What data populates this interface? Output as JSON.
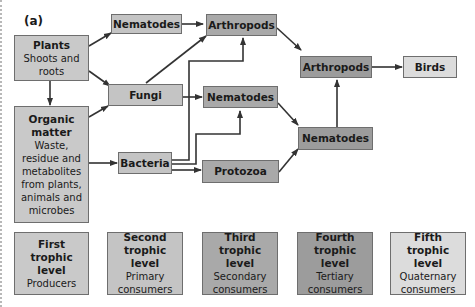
{
  "panel_label": "(a)",
  "nodes": {
    "plants": {
      "title": "Plants",
      "subtitle": "Shoots and roots"
    },
    "organic_matter": {
      "title": "Organic matter",
      "subtitle": "Waste, residue and metabolites from plants, animals and microbes"
    },
    "nematodes_top": {
      "title": "Nematodes"
    },
    "fungi": {
      "title": "Fungi"
    },
    "bacteria": {
      "title": "Bacteria"
    },
    "arthropods_top": {
      "title": "Arthropods"
    },
    "nematodes_mid": {
      "title": "Nematodes"
    },
    "protozoa": {
      "title": "Protozoa"
    },
    "arthropods_right": {
      "title": "Arthropods"
    },
    "nematodes_right": {
      "title": "Nematodes"
    },
    "birds": {
      "title": "Birds"
    }
  },
  "edges": [
    [
      "plants",
      "nematodes_top"
    ],
    [
      "plants",
      "fungi"
    ],
    [
      "plants",
      "organic_matter"
    ],
    [
      "organic_matter",
      "fungi"
    ],
    [
      "organic_matter",
      "bacteria"
    ],
    [
      "nematodes_top",
      "arthropods_top"
    ],
    [
      "fungi",
      "arthropods_top"
    ],
    [
      "fungi",
      "nematodes_mid"
    ],
    [
      "bacteria",
      "arthropods_top"
    ],
    [
      "bacteria",
      "nematodes_mid"
    ],
    [
      "bacteria",
      "protozoa"
    ],
    [
      "arthropods_top",
      "arthropods_right"
    ],
    [
      "nematodes_mid",
      "nematodes_right"
    ],
    [
      "protozoa",
      "nematodes_right"
    ],
    [
      "nematodes_right",
      "arthropods_right"
    ],
    [
      "arthropods_right",
      "birds"
    ]
  ],
  "legend": [
    {
      "title": "First trophic level",
      "subtitle": "Producers"
    },
    {
      "title": "Second trophic level",
      "subtitle": "Primary consumers"
    },
    {
      "title": "Third trophic level",
      "subtitle": "Secondary consumers"
    },
    {
      "title": "Fourth trophic level",
      "subtitle": "Tertiary consumers"
    },
    {
      "title": "Fifth trophic level",
      "subtitle": "Quaternary consumers"
    }
  ],
  "colors": {
    "first": "#c9c9c9",
    "second": "#c4c4c4",
    "third": "#a9a9a9",
    "fourth": "#9c9c9c",
    "fifth": "#dcdcdc"
  }
}
